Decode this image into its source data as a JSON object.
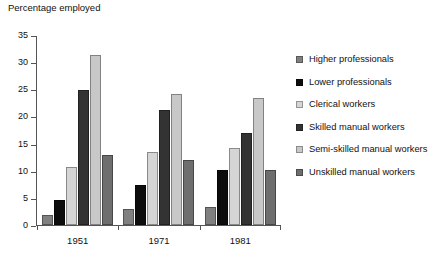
{
  "chart_data": {
    "type": "bar",
    "title": "",
    "ylabel": "Percentage employed",
    "xlabel": "",
    "categories": [
      "1951",
      "1971",
      "1981"
    ],
    "ylim": [
      0,
      35
    ],
    "yticks": [
      0,
      5,
      10,
      15,
      20,
      25,
      30,
      35
    ],
    "grid": false,
    "legend_position": "right",
    "series": [
      {
        "name": "Higher professionals",
        "color": "#808080",
        "values": [
          1.8,
          2.9,
          3.3
        ]
      },
      {
        "name": "Lower professionals",
        "color": "#0d0d0d",
        "values": [
          4.6,
          7.4,
          10.2
        ]
      },
      {
        "name": "Clerical workers",
        "color": "#d5d5d5",
        "values": [
          10.6,
          13.4,
          14.1
        ]
      },
      {
        "name": "Skilled manual workers",
        "color": "#333333",
        "values": [
          24.8,
          21.2,
          16.9
        ]
      },
      {
        "name": "Semi-skilled manual workers",
        "color": "#c8c8c8",
        "values": [
          31.3,
          24.2,
          23.4
        ]
      },
      {
        "name": "Unskilled manual workers",
        "color": "#6e6e6e",
        "values": [
          12.9,
          12.0,
          10.1
        ]
      }
    ]
  },
  "legend": {
    "items": [
      "Higher professionals",
      "Lower professionals",
      "Clerical workers",
      "Skilled manual workers",
      "Semi-skilled manual workers",
      "Unskilled manual workers"
    ]
  }
}
